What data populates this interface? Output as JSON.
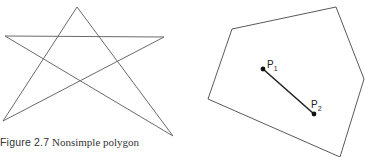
{
  "figure": {
    "label": "Figure 2.7",
    "caption": "Nonsimple polygon"
  },
  "star_polygon": {
    "points": "77,7 173,136 5,36 164,37 3,121 77,7",
    "stroke": "#6a6a6a"
  },
  "convex_polygon": {
    "points": "232,29 336,7 364,79 340,157 208,99",
    "stroke": "#5a5a5a"
  },
  "segment": {
    "p1": {
      "label": "P",
      "sub": "1",
      "x": 263,
      "y": 69
    },
    "p2": {
      "label": "P",
      "sub": "2",
      "x": 314,
      "y": 114
    }
  }
}
